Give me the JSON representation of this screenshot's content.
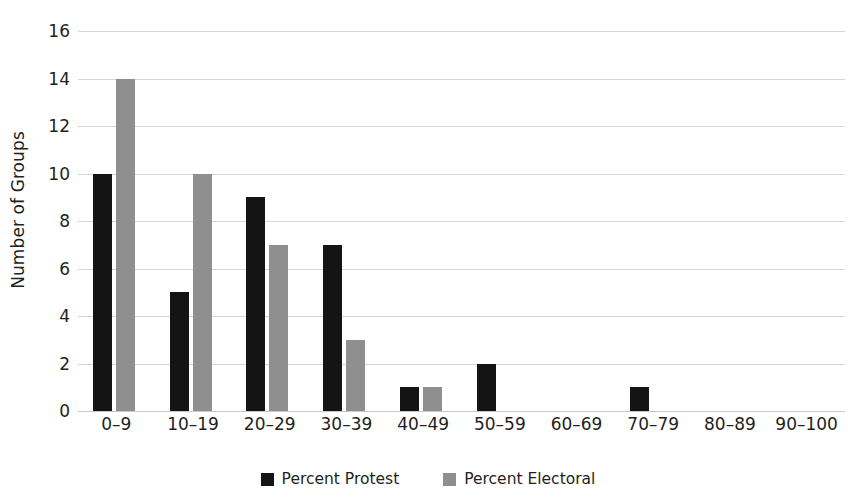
{
  "chart_data": {
    "type": "bar",
    "title": "",
    "subtitle": "",
    "xlabel": "",
    "ylabel": "Number of Groups",
    "ylim": [
      0,
      16
    ],
    "ytick_step": 2,
    "yticks": [
      16,
      14,
      12,
      10,
      8,
      6,
      4,
      2,
      0
    ],
    "grid": true,
    "grid_axis": "y",
    "legend_position": "bottom-center",
    "categories": [
      "0–9",
      "10–19",
      "20–29",
      "30–39",
      "40–49",
      "50–59",
      "60–69",
      "70–79",
      "80–89",
      "90–100"
    ],
    "series": [
      {
        "name": "Percent Protest",
        "color": "#141414",
        "values": [
          10,
          5,
          9,
          7,
          1,
          2,
          0,
          1,
          0,
          0
        ]
      },
      {
        "name": "Percent Electoral",
        "color": "#8f8f8f",
        "values": [
          14,
          10,
          7,
          3,
          1,
          0,
          0,
          0,
          0,
          0
        ]
      }
    ]
  },
  "legend": {
    "items": [
      {
        "label": "Percent Protest",
        "color": "#141414",
        "swatch_name": "legend-swatch-protest"
      },
      {
        "label": "Percent Electoral",
        "color": "#8f8f8f",
        "swatch_name": "legend-swatch-electoral"
      }
    ]
  },
  "axes": {
    "y_title": "Number of Groups",
    "y_tick_labels": [
      "16",
      "14",
      "12",
      "10",
      "8",
      "6",
      "4",
      "2",
      "0"
    ],
    "x_tick_labels": [
      "0–9",
      "10–19",
      "20–29",
      "30–39",
      "40–49",
      "50–59",
      "60–69",
      "70–79",
      "80–89",
      "90–100"
    ]
  },
  "colors": {
    "background": "#ffffff",
    "gridline": "#d7d7d7",
    "baseline": "#c9c9c9",
    "text": "#231f20",
    "series_protest": "#141414",
    "series_electoral": "#8f8f8f"
  }
}
